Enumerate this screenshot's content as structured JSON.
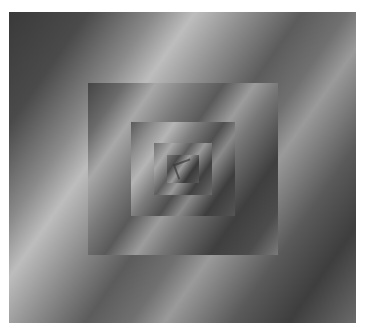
{
  "artwork": {
    "type": "nested-squares-droste",
    "gradient_direction": "diagonal bands, bottom-left to top-right",
    "palette": {
      "dark": "#3a3a3a",
      "mid": "#707070",
      "light": "#bdbdbd"
    },
    "layers": [
      {
        "name": "outer-square",
        "x": 9,
        "y": 12,
        "width": 347,
        "height": 311
      },
      {
        "name": "square-2",
        "x": 88,
        "y": 83,
        "width": 190,
        "height": 172
      },
      {
        "name": "square-3",
        "x": 131,
        "y": 122,
        "width": 104,
        "height": 94
      },
      {
        "name": "square-4",
        "x": 154,
        "y": 143,
        "width": 58,
        "height": 52
      },
      {
        "name": "square-5",
        "x": 167,
        "y": 155,
        "width": 32,
        "height": 28
      }
    ]
  }
}
